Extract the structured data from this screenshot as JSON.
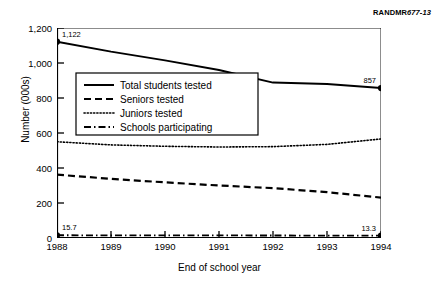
{
  "figure": {
    "id_prefix": "RANDMR",
    "id_suffix": "677-13"
  },
  "chart_data": {
    "type": "line",
    "title": "",
    "xlabel": "End of school year",
    "ylabel": "Number (000s)",
    "x": [
      1988,
      1989,
      1990,
      1991,
      1992,
      1993,
      1994
    ],
    "xtick_labels": [
      "1988",
      "1989",
      "1990",
      "1991",
      "1992",
      "1993",
      "1994"
    ],
    "ytick_labels": [
      "0",
      "200",
      "400",
      "600",
      "800",
      "1,000",
      "1,200"
    ],
    "ytick_values": [
      0,
      200,
      400,
      600,
      800,
      1000,
      1200
    ],
    "ylim": [
      0,
      1200
    ],
    "xlim": [
      1988,
      1994
    ],
    "grid": false,
    "legend_position": "upper-left-inside",
    "series": [
      {
        "name": "Total students tested",
        "style": "solid",
        "values": [
          1122,
          1065,
          1015,
          960,
          888,
          880,
          857
        ]
      },
      {
        "name": "Seniors tested",
        "style": "dashed",
        "values": [
          362,
          338,
          318,
          300,
          285,
          262,
          231
        ]
      },
      {
        "name": "Juniors tested",
        "style": "dotted",
        "values": [
          550,
          532,
          524,
          520,
          522,
          535,
          566
        ]
      },
      {
        "name": "Schools participating",
        "style": "dash-dot",
        "values": [
          15.7,
          15.2,
          14.9,
          14.6,
          14.3,
          13.9,
          13.3
        ]
      }
    ],
    "annotations": [
      {
        "text": "1,122",
        "series": "Total students tested",
        "x": 1988,
        "y": 1122
      },
      {
        "text": "857",
        "series": "Total students tested",
        "x": 1994,
        "y": 857
      },
      {
        "text": "15.7",
        "series": "Schools participating",
        "x": 1988,
        "y": 15.7
      },
      {
        "text": "13.3",
        "series": "Schools participating",
        "x": 1994,
        "y": 13.3
      }
    ],
    "endpoint_markers": [
      {
        "x": 1988,
        "y": 1122
      },
      {
        "x": 1994,
        "y": 857
      },
      {
        "x": 1988,
        "y": 15.7
      },
      {
        "x": 1994,
        "y": 13.3
      }
    ],
    "colors": {
      "line": "#000000",
      "background": "#ffffff",
      "frame": "#000000"
    }
  },
  "legend": {
    "items": [
      {
        "label": "Total students tested",
        "style": "solid"
      },
      {
        "label": "Seniors tested",
        "style": "dashed"
      },
      {
        "label": "Juniors tested",
        "style": "dotted"
      },
      {
        "label": "Schools participating",
        "style": "dash-dot"
      }
    ]
  }
}
